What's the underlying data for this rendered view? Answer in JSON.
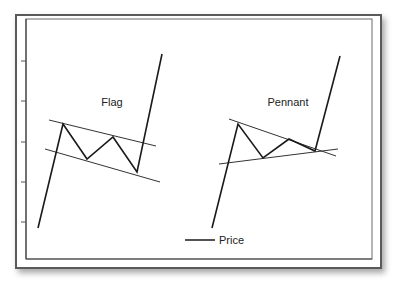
{
  "chart_data": {
    "type": "line",
    "title": "",
    "xlabel": "",
    "ylabel": "",
    "grid": false,
    "legend": {
      "position": "bottom-center",
      "entries": [
        "Price"
      ]
    },
    "annotations": [
      {
        "text": "Flag",
        "x": 112,
        "y": 102
      },
      {
        "text": "Pennant",
        "x": 288,
        "y": 102
      }
    ],
    "y_ticks_px": [
      61,
      101,
      142,
      182,
      222
    ],
    "series": [
      {
        "name": "Price (Flag)",
        "points": [
          [
            38,
            228
          ],
          [
            63,
            124
          ],
          [
            87,
            159
          ],
          [
            113,
            137
          ],
          [
            137,
            172
          ],
          [
            162,
            54
          ]
        ]
      },
      {
        "name": "Price (Pennant)",
        "points": [
          [
            212,
            228
          ],
          [
            238,
            124
          ],
          [
            263,
            158
          ],
          [
            289,
            139
          ],
          [
            315,
            151
          ],
          [
            340,
            56
          ]
        ]
      }
    ],
    "trendlines": [
      {
        "name": "Flag upper channel",
        "points": [
          [
            49,
            120
          ],
          [
            156,
            146
          ]
        ]
      },
      {
        "name": "Flag lower channel",
        "points": [
          [
            45,
            149
          ],
          [
            160,
            182
          ]
        ]
      },
      {
        "name": "Pennant upper line",
        "points": [
          [
            229,
            119
          ],
          [
            336,
            156
          ]
        ]
      },
      {
        "name": "Pennant lower line",
        "points": [
          [
            219,
            164
          ],
          [
            338,
            149
          ]
        ]
      }
    ]
  },
  "labels": {
    "flag": "Flag",
    "pennant": "Pennant",
    "legend_price": "Price"
  },
  "colors": {
    "line": "#1a1a1a",
    "trend": "#333333",
    "frame": "#5a5a5a"
  }
}
